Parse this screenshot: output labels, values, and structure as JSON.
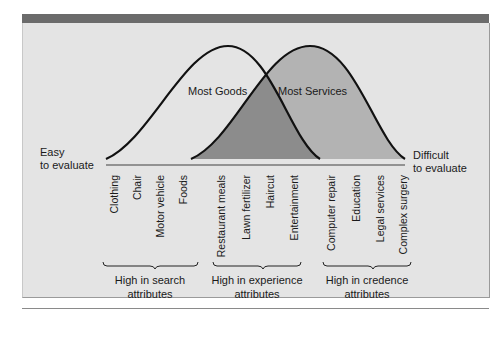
{
  "diagram": {
    "left_end_label": [
      "Easy",
      "to evaluate"
    ],
    "right_end_label": [
      "Difficult",
      "to evaluate"
    ],
    "curves": [
      {
        "name": "Most Goods",
        "fill": "none"
      },
      {
        "name": "Most Services",
        "fill": "#b3b3b3"
      }
    ],
    "overlap_fill": "#8c8c8c",
    "items": [
      "Clothing",
      "Chair",
      "Motor vehicle",
      "Foods",
      "Restaurant meals",
      "Lawn fertilizer",
      "Haircut",
      "Entertainment",
      "Computer repair",
      "Education",
      "Legal services",
      "Complex surgery"
    ],
    "groups": [
      {
        "line1": "High in search",
        "line2": "attributes"
      },
      {
        "line1": "High in experience",
        "line2": "attributes"
      },
      {
        "line1": "High in credence",
        "line2": "attributes"
      }
    ],
    "colors": {
      "header_bar": "#6b6b6b",
      "panel_bg": "#e4e4e4",
      "services_fill": "#b3b3b3",
      "overlap_fill": "#8c8c8c"
    }
  }
}
